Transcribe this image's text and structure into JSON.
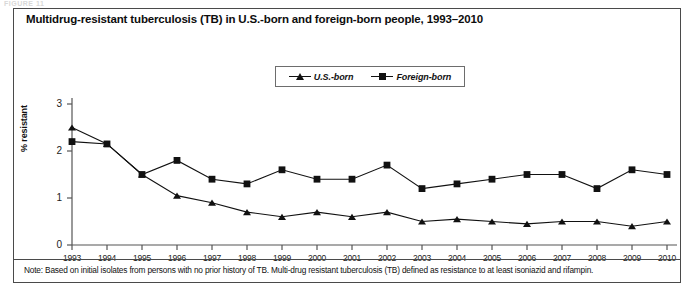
{
  "figure": {
    "ghost_header": "FIGURE 11",
    "title": "Multidrug-resistant tuberculosis (TB) in U.S.-born and foreign-born people, 1993–2010",
    "note": "Note: Based on initial isolates from persons with no prior history of TB. Multi-drug resistant tuberculosis (TB) defined as resistance to at least isoniazid and rifampin."
  },
  "colors": {
    "line": "#111111",
    "axis": "#555555",
    "frame": "#4a4a4a",
    "background": "#ffffff"
  },
  "chart_data": {
    "type": "line",
    "title": "Multidrug-resistant tuberculosis (TB) in U.S.-born and foreign-born people, 1993–2010",
    "xlabel": "",
    "ylabel": "% resistant",
    "categories": [
      "1993",
      "1994",
      "1995",
      "1996",
      "1997",
      "1998",
      "1999",
      "2000",
      "2001",
      "2002",
      "2003",
      "2004",
      "2005",
      "2006",
      "2007",
      "2008",
      "2009",
      "2010"
    ],
    "yticks": [
      "0",
      "1",
      "2",
      "3"
    ],
    "ylim": [
      0,
      3
    ],
    "grid": false,
    "legend_position": "top-center",
    "series": [
      {
        "name": "U.S.-born",
        "marker": "triangle",
        "values": [
          2.5,
          2.15,
          1.5,
          1.05,
          0.9,
          0.7,
          0.6,
          0.7,
          0.6,
          0.7,
          0.5,
          0.55,
          0.5,
          0.45,
          0.5,
          0.5,
          0.4,
          0.5
        ]
      },
      {
        "name": "Foreign-born",
        "marker": "square",
        "values": [
          2.2,
          2.15,
          1.5,
          1.8,
          1.4,
          1.3,
          1.6,
          1.4,
          1.4,
          1.7,
          1.2,
          1.3,
          1.4,
          1.5,
          1.5,
          1.2,
          1.6,
          1.5
        ]
      }
    ]
  },
  "legend": {
    "entries": [
      {
        "label": "U.S.-born",
        "marker": "triangle-marker"
      },
      {
        "label": "Foreign-born",
        "marker": "square-marker"
      }
    ]
  }
}
